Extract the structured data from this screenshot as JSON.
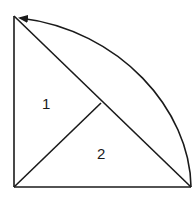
{
  "diagram": {
    "stroke_color": "#1a1a1a",
    "background": "#ffffff",
    "points": {
      "top_left": [
        14,
        16
      ],
      "bottom_left": [
        14,
        187
      ],
      "bottom_right": [
        191,
        187
      ],
      "midpoint": [
        101,
        103
      ]
    },
    "regions": [
      {
        "label": "1",
        "x": 42,
        "y": 96
      },
      {
        "label": "2",
        "x": 97,
        "y": 146
      }
    ],
    "arrow": {
      "from": [
        191,
        187
      ],
      "to": [
        14,
        16
      ],
      "description": "curved arrow arc from bottom-right to top-left"
    }
  }
}
